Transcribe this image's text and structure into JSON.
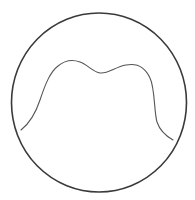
{
  "diagram": {
    "colors": {
      "background": "#ffffff",
      "circle_stroke": "#3a3a3a",
      "curve_stroke": "#555555"
    }
  }
}
